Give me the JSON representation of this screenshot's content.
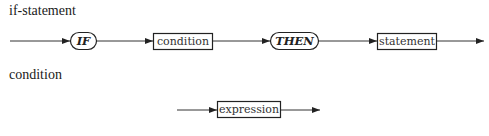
{
  "diagrams": [
    {
      "title": "if-statement",
      "nodes": [
        {
          "type": "terminal",
          "label": "IF"
        },
        {
          "type": "nonterminal",
          "label": "condition"
        },
        {
          "type": "terminal",
          "label": "THEN"
        },
        {
          "type": "nonterminal",
          "label": "statement"
        }
      ]
    },
    {
      "title": "condition",
      "nodes": [
        {
          "type": "nonterminal",
          "label": "expression"
        }
      ]
    }
  ]
}
